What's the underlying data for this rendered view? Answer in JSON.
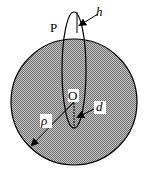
{
  "diagram": {
    "labels": {
      "point_p": "P",
      "origin": "O",
      "radius": "ρ",
      "height": "h",
      "distance": "d"
    },
    "colors": {
      "sphere_fill": "#9a9a9a",
      "stroke": "#000000",
      "background": "#ffffff"
    }
  }
}
